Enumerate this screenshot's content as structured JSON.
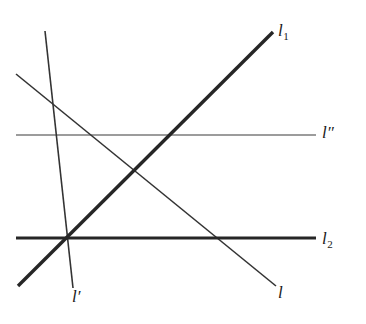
{
  "figure": {
    "background_color": "#ffffff",
    "stroke_color": "#262626",
    "width": 366,
    "height": 324
  },
  "labels": {
    "l1": {
      "base": "l",
      "sub": "1",
      "prime": "",
      "x": 278,
      "y": 22
    },
    "l2": {
      "base": "l",
      "sub": "2",
      "prime": "",
      "x": 322,
      "y": 230
    },
    "l_double_prime": {
      "base": "l",
      "sub": "",
      "prime": "″",
      "x": 322,
      "y": 124
    },
    "l_prime": {
      "base": "l",
      "sub": "",
      "prime": "′",
      "x": 72,
      "y": 288
    },
    "l": {
      "base": "l",
      "sub": "",
      "prime": "",
      "x": 278,
      "y": 284
    }
  },
  "chart_data": {
    "type": "diagram",
    "title": "",
    "xlabel": "",
    "ylabel": "",
    "coordinate_space": {
      "width": 366,
      "height": 324,
      "origin": "top-left"
    },
    "lines": [
      {
        "name": "l1",
        "label": "l₁",
        "style": "thick",
        "stroke_width": 3.4,
        "color": "#262626",
        "x1": 18,
        "y1": 286,
        "x2": 273,
        "y2": 32
      },
      {
        "name": "l2",
        "label": "l₂",
        "style": "thick",
        "stroke_width": 3.2,
        "color": "#262626",
        "x1": 16,
        "y1": 238,
        "x2": 316,
        "y2": 238
      },
      {
        "name": "l_double_prime",
        "label": "l″",
        "style": "thin",
        "stroke_width": 1.2,
        "color": "#3a3a3a",
        "x1": 16,
        "y1": 135,
        "x2": 316,
        "y2": 135
      },
      {
        "name": "l",
        "label": "l",
        "style": "thin",
        "stroke_width": 1.6,
        "color": "#333333",
        "x1": 16,
        "y1": 74,
        "x2": 276,
        "y2": 286
      },
      {
        "name": "l_prime",
        "label": "l′",
        "style": "thin",
        "stroke_width": 1.6,
        "color": "#333333",
        "x1": 45,
        "y1": 31,
        "x2": 73,
        "y2": 288
      }
    ],
    "intersections": [
      {
        "of": [
          "l1",
          "l2",
          "l_prime"
        ],
        "x": 68,
        "y": 238
      },
      {
        "of": [
          "l1",
          "l_double_prime"
        ],
        "x": 173,
        "y": 135
      },
      {
        "of": [
          "l1",
          "l"
        ],
        "x": 130,
        "y": 174
      },
      {
        "of": [
          "l",
          "l_double_prime"
        ],
        "x": 91,
        "y": 135
      },
      {
        "of": [
          "l",
          "l_prime"
        ],
        "x": 56,
        "y": 106
      },
      {
        "of": [
          "l",
          "l2"
        ],
        "x": 218,
        "y": 238
      },
      {
        "of": [
          "l_prime",
          "l_double_prime"
        ],
        "x": 56,
        "y": 136
      }
    ]
  }
}
